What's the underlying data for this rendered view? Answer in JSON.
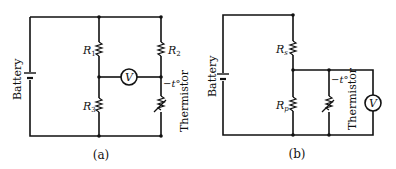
{
  "circuit_a": {
    "caption": "(a)",
    "battery_label": "Battery",
    "r1": "R",
    "r1_sub": "1",
    "r2": "R",
    "r2_sub": "2",
    "r3": "R",
    "r3_sub": "3",
    "voltmeter": "V",
    "thermistor_label": "Thermistor",
    "temp_label": "−t°"
  },
  "circuit_b": {
    "caption": "(b)",
    "battery_label": "Battery",
    "rs": "R",
    "rs_sub": "s",
    "rp": "R",
    "rp_sub": "p",
    "voltmeter": "V",
    "thermistor_label": "Thermistor",
    "temp_label": "−t°"
  }
}
